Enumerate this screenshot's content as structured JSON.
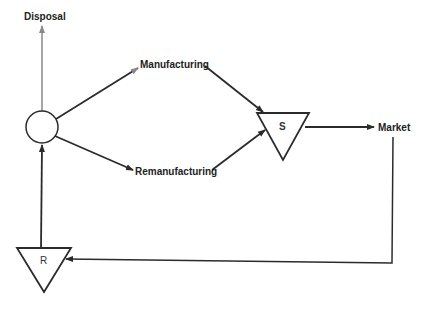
{
  "diagram": {
    "nodes": {
      "hub": {
        "shape": "circle",
        "label": ""
      },
      "storage_s": {
        "shape": "inverted-triangle",
        "label": "S"
      },
      "storage_r": {
        "shape": "inverted-triangle",
        "label": "R"
      }
    },
    "labels": {
      "disposal": "Disposal",
      "manufacturing": "Manufacturing",
      "remanufacturing": "Remanufacturing",
      "market": "Market"
    },
    "edges": [
      {
        "from": "hub",
        "to": "Disposal"
      },
      {
        "from": "hub",
        "to": "Manufacturing"
      },
      {
        "from": "hub",
        "to": "Remanufacturing"
      },
      {
        "from": "Manufacturing",
        "to": "S"
      },
      {
        "from": "Remanufacturing",
        "to": "S"
      },
      {
        "from": "S",
        "to": "Market"
      },
      {
        "from": "Market",
        "to": "R"
      },
      {
        "from": "R",
        "to": "hub"
      }
    ],
    "colors": {
      "line": "#2b2b2b",
      "disposal_line": "#888888",
      "background": "#ffffff"
    }
  }
}
